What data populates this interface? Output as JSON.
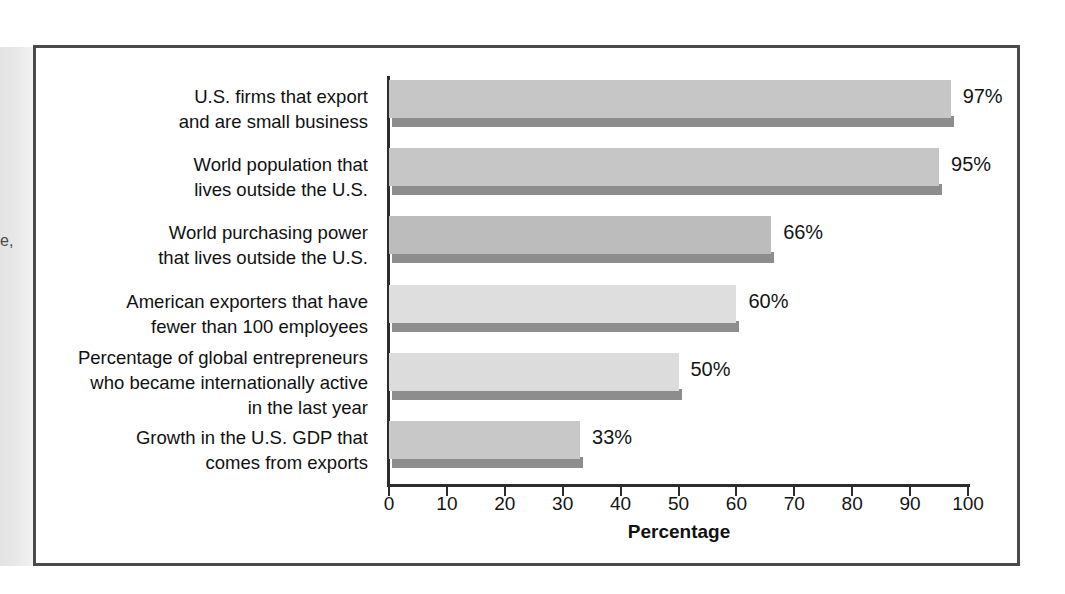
{
  "figure": {
    "bleed_text": "e,",
    "border_color": "#4b4b4b"
  },
  "chart_data": {
    "type": "bar",
    "orientation": "horizontal",
    "title": "",
    "xlabel": "Percentage",
    "ylabel": "",
    "xlim": [
      0,
      100
    ],
    "xticks": [
      0,
      10,
      20,
      30,
      40,
      50,
      60,
      70,
      80,
      90,
      100
    ],
    "xtick_labels": [
      "0",
      "10",
      "20",
      "30",
      "40",
      "50",
      "60",
      "70",
      "80",
      "90",
      "100"
    ],
    "grid": false,
    "legend": false,
    "categories": [
      "U.S. firms that export\nand are small business",
      "World population that\nlives outside the U.S.",
      "World purchasing power\nthat lives outside the U.S.",
      "American exporters that have\nfewer than 100 employees",
      "Percentage of global entrepreneurs\nwho became internationally active\nin the last year",
      "Growth in the U.S. GDP that\ncomes from exports"
    ],
    "values": [
      97,
      95,
      66,
      60,
      50,
      33
    ],
    "data_labels": [
      "97%",
      "95%",
      "66%",
      "60%",
      "50%",
      "33%"
    ],
    "bar_colors": [
      "#c6c6c6",
      "#c6c6c6",
      "#bcbcbc",
      "#dedede",
      "#dcdcdc",
      "#c8c8c8"
    ],
    "bar_shadow_color": "#8d8d8d",
    "axis_color": "#2c2c2c"
  }
}
